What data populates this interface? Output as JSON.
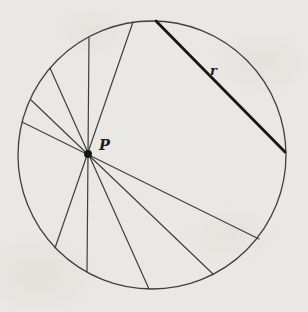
{
  "figure": {
    "type": "circle-with-chords-through-point",
    "background_color": "#e9e8e4",
    "line_color": "#3f3f3f",
    "thick_line_color": "#161616",
    "text_color": "#1c1c1c",
    "circle": {
      "cx": 152,
      "cy": 155,
      "r": 134,
      "stroke_width": 1.3
    },
    "point": {
      "label": "P",
      "x": 88,
      "y": 154,
      "dot_radius": 4,
      "label_x": 99,
      "label_y": 150
    },
    "chords": [
      {
        "x1": 89,
        "y1": 37,
        "x2": 87,
        "y2": 272
      },
      {
        "x1": 133,
        "y1": 22,
        "x2": 55,
        "y2": 248
      },
      {
        "x1": 50,
        "y1": 68,
        "x2": 149,
        "y2": 289
      },
      {
        "x1": 31,
        "y1": 100,
        "x2": 213,
        "y2": 274
      },
      {
        "x1": 22,
        "y1": 122,
        "x2": 259,
        "y2": 239
      }
    ],
    "chord_stroke_width": 1.2,
    "thick_chord": {
      "label": "r",
      "x1": 156,
      "y1": 21,
      "x2": 285,
      "y2": 152,
      "stroke_width": 2.8,
      "label_x": 210,
      "label_y": 75
    }
  }
}
